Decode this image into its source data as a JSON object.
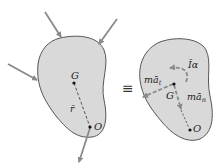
{
  "diagram": {
    "type": "rigid-body kinetics equivalence",
    "left_body": {
      "points": {
        "G": "G",
        "O": "O"
      },
      "position_vector_label": "r̄",
      "applied_forces": 3,
      "reaction_at_O": 1
    },
    "equivalence_symbol": "≡",
    "right_body": {
      "points": {
        "G": "G",
        "O": "O"
      },
      "couple_label": "Īα",
      "tangential_label": "mā",
      "tangential_sub": "t",
      "normal_label": "mā",
      "normal_sub": "n"
    },
    "colors": {
      "body_fill": "#d9d9d9",
      "outline": "#555555",
      "arrow": "#8a8a8a",
      "text": "#222222"
    }
  }
}
